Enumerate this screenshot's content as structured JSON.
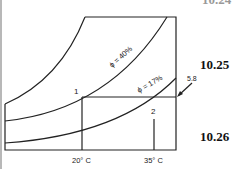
{
  "problems": {
    "top_partial": "10.24",
    "p1": "10.25",
    "p2": "10.26"
  },
  "diagram": {
    "type": "psychrometric-chart-sketch",
    "curves": [
      {
        "name": "saturation",
        "label": ""
      },
      {
        "name": "rh-40",
        "label": "ϕ = 40%"
      },
      {
        "name": "rh-17",
        "label": "ϕ = 17%"
      }
    ],
    "points": [
      {
        "id": "1",
        "label": "1"
      },
      {
        "id": "2",
        "label": "2"
      }
    ],
    "x_ticks": [
      "20° C",
      "35° C"
    ],
    "annotation": "5.8",
    "colors": {
      "line": "#222222",
      "left_bar": "#b8b8b8"
    }
  }
}
